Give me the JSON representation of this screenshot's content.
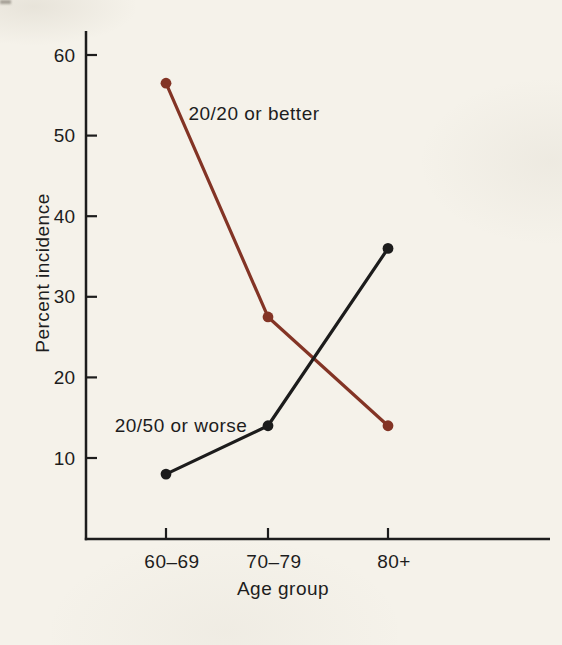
{
  "figure": {
    "background_color": "#f5f2ea",
    "ink_color": "#1d1d1d"
  },
  "chart_data": {
    "type": "line",
    "title": "",
    "xlabel": "Age group",
    "ylabel": "Percent incidence",
    "categories": [
      "60–69",
      "70–79",
      "80+"
    ],
    "series": [
      {
        "name": "20/20 or better",
        "color": "#833425",
        "values": [
          56.5,
          27.5,
          14
        ],
        "label_pos": {
          "x": 254,
          "y": 120
        }
      },
      {
        "name": "20/50 or worse",
        "color": "#1c1c1c",
        "values": [
          8,
          14,
          36
        ],
        "label_pos": {
          "x": 181,
          "y": 432
        }
      }
    ],
    "yticks": [
      10,
      20,
      30,
      40,
      50,
      60
    ],
    "ylim": [
      0,
      63
    ],
    "grid": false,
    "legend": "inline-annotations"
  }
}
